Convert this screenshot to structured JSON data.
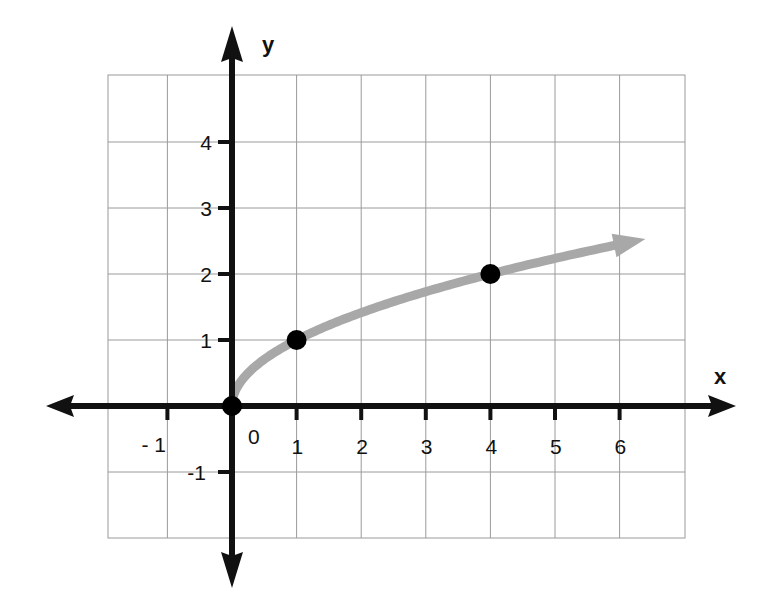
{
  "chart_data": {
    "type": "line",
    "title": "",
    "function": "y = sqrt(x)",
    "xlabel": "x",
    "ylabel": "y",
    "xlim": [
      -2,
      7
    ],
    "ylim": [
      -2,
      5
    ],
    "grid": true,
    "x_ticks": [
      {
        "value": -1,
        "label": "- 1"
      },
      {
        "value": 0,
        "label": "0"
      },
      {
        "value": 1,
        "label": "1"
      },
      {
        "value": 2,
        "label": "2"
      },
      {
        "value": 3,
        "label": "3"
      },
      {
        "value": 4,
        "label": "4"
      },
      {
        "value": 5,
        "label": "5"
      },
      {
        "value": 6,
        "label": "6"
      }
    ],
    "y_ticks": [
      {
        "value": -1,
        "label": "-1"
      },
      {
        "value": 1,
        "label": "1"
      },
      {
        "value": 2,
        "label": "2"
      },
      {
        "value": 3,
        "label": "3"
      },
      {
        "value": 4,
        "label": "4"
      }
    ],
    "series": [
      {
        "name": "y = sqrt(x)",
        "color": "#a8a8a8",
        "x_range": [
          0,
          6.4
        ],
        "arrow_end": true
      }
    ],
    "points": [
      {
        "x": 0,
        "y": 0
      },
      {
        "x": 1,
        "y": 1
      },
      {
        "x": 4,
        "y": 2
      }
    ],
    "colors": {
      "axis": "#111111",
      "grid": "#9a9a9a",
      "curve": "#a8a8a8",
      "points": "#000000"
    }
  }
}
